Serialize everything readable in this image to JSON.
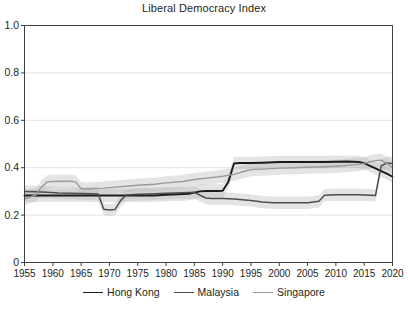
{
  "chart_data": {
    "type": "line",
    "title": "Liberal Democracy Index",
    "xlabel": "",
    "ylabel": "",
    "xlim": [
      1955,
      2020
    ],
    "ylim": [
      0,
      1.0
    ],
    "grid": true,
    "grid_axis": "y",
    "legend_position": "bottom",
    "uncertainty_bands": true,
    "x_ticks": [
      1955,
      1960,
      1965,
      1970,
      1975,
      1980,
      1985,
      1990,
      1995,
      2000,
      2005,
      2010,
      2015,
      2020
    ],
    "x_tick_labels": [
      "1955",
      "1960",
      "1965",
      "1970",
      "1975",
      "1980",
      "1985",
      "1990",
      "1995",
      "2000",
      "2005",
      "2010",
      "2015",
      "2020"
    ],
    "y_ticks": [
      0,
      0.2,
      0.4,
      0.6,
      0.8,
      1.0
    ],
    "y_tick_labels": [
      "0",
      "0.2",
      "0.4",
      "0.6",
      "0.8",
      "1.0"
    ],
    "series": [
      {
        "name": "Hong Kong",
        "color": "#1a1a1a",
        "width": 1.9,
        "x": [
          1955,
          1958,
          1960,
          1963,
          1965,
          1968,
          1970,
          1972,
          1975,
          1978,
          1980,
          1982,
          1984,
          1985,
          1986,
          1987,
          1988,
          1989,
          1990,
          1991,
          1992,
          1993,
          1995,
          1997,
          2000,
          2003,
          2005,
          2008,
          2010,
          2012,
          2014,
          2015,
          2016,
          2017,
          2018,
          2019,
          2020
        ],
        "values": [
          0.283,
          0.283,
          0.283,
          0.283,
          0.283,
          0.283,
          0.283,
          0.283,
          0.283,
          0.283,
          0.286,
          0.288,
          0.29,
          0.295,
          0.3,
          0.302,
          0.302,
          0.302,
          0.303,
          0.34,
          0.418,
          0.42,
          0.42,
          0.421,
          0.424,
          0.424,
          0.424,
          0.424,
          0.425,
          0.426,
          0.424,
          0.419,
          0.408,
          0.397,
          0.386,
          0.375,
          0.362
        ],
        "band_lower": [
          0.255,
          0.255,
          0.255,
          0.255,
          0.255,
          0.255,
          0.255,
          0.255,
          0.255,
          0.255,
          0.258,
          0.26,
          0.262,
          0.267,
          0.272,
          0.274,
          0.274,
          0.274,
          0.275,
          0.312,
          0.392,
          0.394,
          0.394,
          0.395,
          0.398,
          0.398,
          0.398,
          0.398,
          0.399,
          0.4,
          0.398,
          0.393,
          0.382,
          0.371,
          0.36,
          0.349,
          0.335
        ],
        "band_upper": [
          0.311,
          0.311,
          0.311,
          0.311,
          0.311,
          0.311,
          0.311,
          0.311,
          0.311,
          0.311,
          0.314,
          0.316,
          0.318,
          0.323,
          0.328,
          0.33,
          0.33,
          0.33,
          0.331,
          0.368,
          0.444,
          0.446,
          0.446,
          0.447,
          0.45,
          0.45,
          0.45,
          0.45,
          0.451,
          0.452,
          0.45,
          0.445,
          0.434,
          0.423,
          0.412,
          0.401,
          0.389
        ]
      },
      {
        "name": "Malaysia",
        "color": "#4d4d4d",
        "width": 1.5,
        "x": [
          1955,
          1957,
          1959,
          1961,
          1963,
          1965,
          1967,
          1968,
          1969,
          1970,
          1971,
          1972,
          1973,
          1975,
          1978,
          1980,
          1983,
          1985,
          1987,
          1988,
          1990,
          1992,
          1995,
          1997,
          1999,
          2001,
          2003,
          2005,
          2007,
          2008,
          2010,
          2012,
          2014,
          2016,
          2017,
          2018,
          2019,
          2020
        ],
        "values": [
          0.3,
          0.298,
          0.296,
          0.293,
          0.292,
          0.291,
          0.29,
          0.289,
          0.225,
          0.222,
          0.224,
          0.262,
          0.285,
          0.288,
          0.29,
          0.292,
          0.294,
          0.296,
          0.272,
          0.27,
          0.27,
          0.268,
          0.262,
          0.255,
          0.252,
          0.252,
          0.252,
          0.252,
          0.258,
          0.284,
          0.286,
          0.286,
          0.286,
          0.284,
          0.283,
          0.408,
          0.42,
          0.418
        ],
        "band_lower": [
          0.274,
          0.272,
          0.27,
          0.267,
          0.266,
          0.265,
          0.264,
          0.263,
          0.2,
          0.197,
          0.199,
          0.236,
          0.259,
          0.262,
          0.264,
          0.266,
          0.268,
          0.27,
          0.246,
          0.244,
          0.244,
          0.242,
          0.236,
          0.229,
          0.226,
          0.226,
          0.226,
          0.226,
          0.232,
          0.258,
          0.26,
          0.26,
          0.26,
          0.258,
          0.257,
          0.38,
          0.392,
          0.39
        ],
        "band_upper": [
          0.326,
          0.324,
          0.322,
          0.319,
          0.318,
          0.317,
          0.316,
          0.315,
          0.25,
          0.247,
          0.249,
          0.288,
          0.311,
          0.314,
          0.316,
          0.318,
          0.32,
          0.322,
          0.298,
          0.296,
          0.296,
          0.294,
          0.288,
          0.281,
          0.278,
          0.278,
          0.278,
          0.278,
          0.284,
          0.31,
          0.312,
          0.312,
          0.312,
          0.31,
          0.309,
          0.436,
          0.448,
          0.446
        ]
      },
      {
        "name": "Singapore",
        "color": "#9a9a9a",
        "width": 1.4,
        "x": [
          1955,
          1957,
          1958,
          1959,
          1960,
          1962,
          1963,
          1964,
          1965,
          1966,
          1967,
          1969,
          1971,
          1973,
          1975,
          1978,
          1980,
          1983,
          1985,
          1988,
          1990,
          1992,
          1994,
          1995,
          1997,
          2000,
          2003,
          2005,
          2008,
          2010,
          2012,
          2014,
          2015,
          2016,
          2017,
          2018,
          2019,
          2020
        ],
        "values": [
          0.268,
          0.285,
          0.318,
          0.34,
          0.342,
          0.343,
          0.343,
          0.34,
          0.312,
          0.31,
          0.312,
          0.314,
          0.318,
          0.322,
          0.326,
          0.33,
          0.336,
          0.342,
          0.35,
          0.358,
          0.364,
          0.372,
          0.386,
          0.392,
          0.394,
          0.398,
          0.4,
          0.402,
          0.404,
          0.406,
          0.41,
          0.414,
          0.418,
          0.424,
          0.43,
          0.432,
          0.418,
          0.4
        ],
        "band_lower": [
          0.24,
          0.257,
          0.29,
          0.312,
          0.314,
          0.315,
          0.315,
          0.312,
          0.284,
          0.282,
          0.284,
          0.286,
          0.29,
          0.294,
          0.298,
          0.302,
          0.308,
          0.314,
          0.322,
          0.33,
          0.336,
          0.344,
          0.358,
          0.364,
          0.366,
          0.37,
          0.372,
          0.374,
          0.376,
          0.378,
          0.382,
          0.386,
          0.39,
          0.396,
          0.402,
          0.404,
          0.39,
          0.372
        ],
        "band_upper": [
          0.296,
          0.313,
          0.346,
          0.368,
          0.37,
          0.371,
          0.371,
          0.368,
          0.34,
          0.338,
          0.34,
          0.342,
          0.346,
          0.35,
          0.354,
          0.358,
          0.364,
          0.37,
          0.378,
          0.386,
          0.392,
          0.4,
          0.414,
          0.42,
          0.422,
          0.426,
          0.428,
          0.43,
          0.432,
          0.434,
          0.438,
          0.442,
          0.446,
          0.452,
          0.458,
          0.46,
          0.446,
          0.428
        ]
      }
    ]
  },
  "legend": {
    "items": [
      {
        "label": "Hong Kong",
        "color": "#1a1a1a",
        "width": "1.9px"
      },
      {
        "label": "Malaysia",
        "color": "#4d4d4d",
        "width": "1.5px"
      },
      {
        "label": "Singapore",
        "color": "#9a9a9a",
        "width": "1.4px"
      }
    ]
  },
  "axes": {
    "frame_color": "#3f3f3f",
    "grid_color": "#dcdcdc",
    "band_color": "#b9b9b9"
  }
}
